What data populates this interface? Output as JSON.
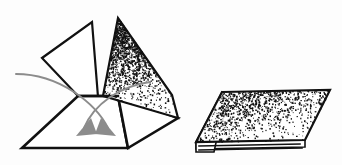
{
  "figure": {
    "background_color": "#fdfdfd",
    "ink_color": "#111111",
    "motion_color": "#8c8c8c",
    "speckle_color": "#111111",
    "canvas": {
      "width": 342,
      "height": 165
    },
    "captions": {
      "left_figure": "open folded sheet",
      "right_figure": "closed flat sheet",
      "motion": "closing motion arrows"
    },
    "left_figure": {
      "name": "open-folded-sheet",
      "panels": {
        "plain_back_panel": {
          "label": "plain back panel",
          "points": "42,58 92,22 98,97 78,96"
        },
        "front_panel": {
          "label": "plain front panel",
          "points": "22,148 78,96 118,96 128,148"
        },
        "speckled_panel": {
          "label": "speckled panel",
          "points": "103,96 118,18 172,95 178,118"
        },
        "speckled_side_flap": {
          "label": "speckled side flap",
          "points": "128,148 118,96 178,118"
        }
      },
      "fold_line": {
        "label": "fold crease",
        "points": "78,96 118,96"
      }
    },
    "motion_arrows": {
      "name": "closing-motion",
      "arcs": [
        {
          "label": "left closing arc",
          "path": "M 16,74 C 60,74 96,104 108,128",
          "head": "101,118 116,136 95,134"
        },
        {
          "label": "right closing arc",
          "path": "M 150,82 C 120,86 94,104 84,128",
          "head": "91,118 76,136 97,134"
        }
      ]
    },
    "right_figure": {
      "name": "closed-flat-sheet",
      "top_face": {
        "label": "speckled top face",
        "points": "222,92 330,90 305,140 196,142"
      },
      "front_edge": {
        "label": "front sheet edge",
        "points": "196,142 305,140 305,147 196,149"
      },
      "spine_edge": {
        "label": "spine fold edge",
        "points": "222,92 196,142 196,152 214,152 226,96"
      },
      "edge_lines": [
        {
          "label": "spine inner line",
          "points": "199,146 300,144"
        },
        {
          "label": "spine outer line",
          "points": "199,150 302,148"
        }
      ]
    },
    "speckle_fields": [
      {
        "name": "left-panel-speckle",
        "region": "speckled_panel",
        "density_direction": "dense at top, sparse at bottom",
        "dot_count": 1150,
        "seed": 7
      },
      {
        "name": "right-slab-speckle",
        "region": "top_face",
        "density_direction": "dense at top-left, sparse at bottom-right",
        "dot_count": 1050,
        "seed": 21
      }
    ]
  }
}
